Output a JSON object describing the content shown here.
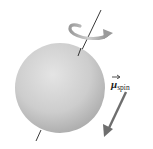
{
  "figure": {
    "type": "physics-diagram",
    "sphere_color": "#c8c8c8",
    "axis_color": "#222222",
    "rotation_arrow_color": "#a0a0a0",
    "moment_arrow_color": "#6e6e6e"
  },
  "labels": {
    "moment_symbol": "μ",
    "moment_subscript": "spin"
  }
}
